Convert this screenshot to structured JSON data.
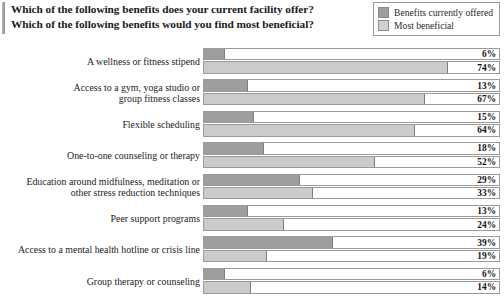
{
  "title": {
    "line1": "Which of the following benefits does your current facility offer?",
    "line2": "Which of the following benefits would you find most beneficial?"
  },
  "legend": {
    "items": [
      {
        "label": "Benefits currently offered",
        "color": "#9d9d9d",
        "swatch": "legend-swatch-offered"
      },
      {
        "label": "Most beneficial",
        "color": "#d0d0d0",
        "swatch": "legend-swatch-beneficial"
      }
    ]
  },
  "chart_data": {
    "type": "bar",
    "orientation": "horizontal",
    "title": "Which of the following benefits does your current facility offer? Which of the following benefits would you find most beneficial?",
    "xlabel": "",
    "ylabel": "",
    "xlim": [
      0,
      90
    ],
    "grid": false,
    "legend_position": "top-right",
    "value_suffix": "%",
    "categories": [
      "A wellness or fitness stipend",
      "Access to a gym, yoga studio or group fitness classes",
      "Flexible scheduling",
      "One-to-one counseling or therapy",
      "Education around midfulness, meditation or other stress reduction techniques",
      "Peer support programs",
      "Access to a mental health hotline or crisis line",
      "Group therapy or counseling"
    ],
    "category_lines": [
      [
        "A wellness or fitness stipend"
      ],
      [
        "Access to a gym, yoga studio or",
        "group fitness classes"
      ],
      [
        "Flexible scheduling"
      ],
      [
        "One-to-one counseling or therapy"
      ],
      [
        "Education around midfulness, meditation or",
        "other stress reduction techniques"
      ],
      [
        "Peer support programs"
      ],
      [
        "Access to a mental health hotline or crisis line"
      ],
      [
        "Group therapy or counseling"
      ]
    ],
    "series": [
      {
        "name": "Benefits currently offered",
        "color": "#9e9e9e",
        "values": [
          6,
          13,
          15,
          18,
          29,
          13,
          39,
          6
        ]
      },
      {
        "name": "Most beneficial",
        "color": "#cbcbcb",
        "values": [
          74,
          67,
          64,
          52,
          33,
          24,
          19,
          14
        ]
      }
    ],
    "value_labels": [
      [
        "6%",
        "74%"
      ],
      [
        "13%",
        "67%"
      ],
      [
        "15%",
        "64%"
      ],
      [
        "18%",
        "52%"
      ],
      [
        "29%",
        "33%"
      ],
      [
        "13%",
        "24%"
      ],
      [
        "39%",
        "19%"
      ],
      [
        "6%",
        "14%"
      ]
    ]
  }
}
